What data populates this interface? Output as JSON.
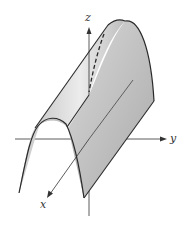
{
  "figure": {
    "axes": {
      "x_label": "x",
      "y_label": "y",
      "z_label": "z"
    },
    "colors": {
      "surface_light": "#e6e6e6",
      "surface_dark": "#b4b4b4",
      "edge": "#2a2a2a",
      "axis": "#333333",
      "background": "#ffffff"
    }
  }
}
